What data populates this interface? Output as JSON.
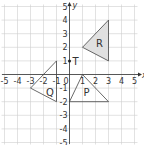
{
  "diagram": {
    "type": "coordinate-grid",
    "x_axis": {
      "label": "x",
      "min": -5,
      "max": 5,
      "ticks": [
        "-5",
        "-4",
        "-3",
        "-2",
        "-1",
        "0",
        "1",
        "2",
        "3",
        "4",
        "5"
      ]
    },
    "y_axis": {
      "label": "y",
      "min": -5,
      "max": 5,
      "ticks": [
        "-5",
        "-4",
        "-3",
        "-2",
        "-1",
        "1",
        "2",
        "3",
        "4",
        "5"
      ]
    },
    "origin_label": "0",
    "shapes": [
      {
        "name": "R",
        "vertices": [
          [
            1,
            2
          ],
          [
            3,
            4
          ],
          [
            3,
            1
          ]
        ],
        "fill": "#e0e0e0",
        "label_at": [
          2.3,
          2.3
        ]
      },
      {
        "name": "Q",
        "vertices": [
          [
            -1,
            1
          ],
          [
            -3,
            -1
          ],
          [
            -1,
            -2
          ]
        ],
        "fill": "none",
        "label_at": [
          -1.5,
          -1.3
        ]
      },
      {
        "name": "P",
        "vertices": [
          [
            1,
            0
          ],
          [
            0,
            -2
          ],
          [
            3,
            -2
          ]
        ],
        "fill": "none",
        "label_at": [
          1.3,
          -1.3
        ]
      }
    ],
    "points": [
      {
        "name": "T",
        "at": [
          0,
          1
        ]
      }
    ]
  }
}
